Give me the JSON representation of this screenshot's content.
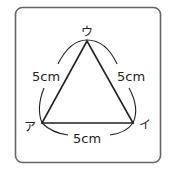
{
  "figure": {
    "vertices": {
      "top": "ウ",
      "left": "ア",
      "right": "イ"
    },
    "side_labels": {
      "left": "5cm",
      "right": "5cm",
      "bottom": "5cm"
    },
    "colors": {
      "stroke": "#222222",
      "frame": "#555555",
      "background": "#ffffff"
    }
  }
}
